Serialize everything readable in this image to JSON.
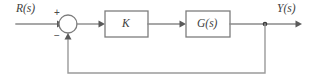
{
  "diagram": {
    "type": "block-diagram",
    "width": 312,
    "height": 83,
    "background_color": "#ffffff",
    "line_color": "#8a8a8a",
    "block_border_color": "#7d7d7d",
    "text_color": "#3d3d3d",
    "signals": {
      "input_label": "R(s)",
      "output_label": "Y(s)"
    },
    "summing_junction": {
      "name": "summing-junction",
      "plus_sign": "+",
      "minus_sign": "−",
      "center_x": 68,
      "center_y": 24,
      "radius": 9
    },
    "blocks": [
      {
        "id": "gain",
        "label": "K",
        "x": 105,
        "y": 11,
        "width": 43,
        "height": 26
      },
      {
        "id": "plant",
        "label": "G(s)",
        "x": 186,
        "y": 11,
        "width": 44,
        "height": 26
      }
    ],
    "nodes": [
      {
        "id": "output-takeoff",
        "name": "feedback-takeoff-node",
        "x": 265,
        "y": 24
      }
    ],
    "connections": [
      {
        "from": "input",
        "to": "summing-junction",
        "sign": "+"
      },
      {
        "from": "summing-junction",
        "to": "gain",
        "sign": ""
      },
      {
        "from": "gain",
        "to": "plant",
        "sign": ""
      },
      {
        "from": "plant",
        "to": "output",
        "sign": ""
      },
      {
        "from": "feedback-takeoff-node",
        "to": "summing-junction",
        "sign": "−"
      }
    ]
  }
}
